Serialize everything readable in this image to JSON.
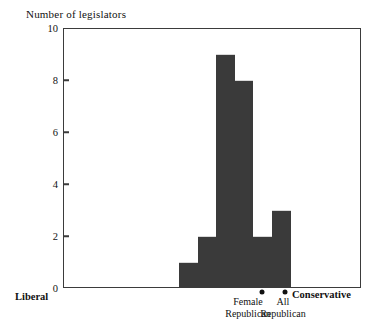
{
  "chart_data": {
    "type": "bar",
    "title": "Number of legislators",
    "xlabel": "",
    "ylabel": "Number of legislators",
    "ylim": [
      0,
      10
    ],
    "yticks": [
      0,
      2,
      4,
      6,
      8,
      10
    ],
    "grid": false,
    "legend": "none",
    "categories": [
      "1",
      "2",
      "3",
      "4",
      "5",
      "6"
    ],
    "values": [
      1,
      2,
      9,
      8,
      2,
      3
    ],
    "axis_endpoint_labels": {
      "left": "Liberal",
      "right": "Conservative"
    },
    "annotations": [
      {
        "marker": "dot",
        "line1": "Female",
        "line2": "Republican"
      },
      {
        "marker": "dot",
        "line1": "All",
        "line2": "Republican"
      }
    ],
    "colors": {
      "bar_fill": "#3a3a3a",
      "axis": "#3b3b3b",
      "text": "#111111",
      "background": "#ffffff"
    }
  },
  "ytick_labels": [
    "0",
    "2",
    "4",
    "6",
    "8",
    "10"
  ]
}
